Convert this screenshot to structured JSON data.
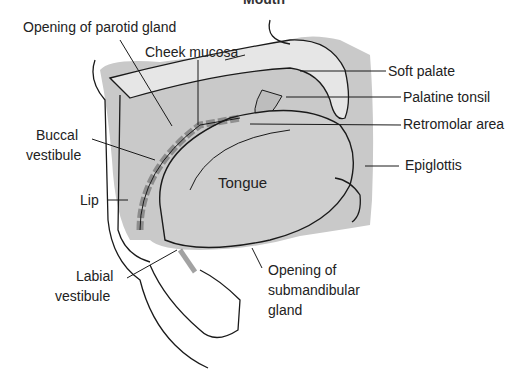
{
  "figure": {
    "header_fragment": "Mouth",
    "colors": {
      "shade": "#c9c9c9",
      "shade_dark": "#b5b5b5",
      "line": "#1a1a1a",
      "background": "#ffffff"
    }
  },
  "labels": {
    "parotid": "Opening of parotid gland",
    "cheek": "Cheek mucosa",
    "soft_palate": "Soft palate",
    "palatine_tonsil": "Palatine tonsil",
    "retromolar": "Retromolar area",
    "buccal_1": "Buccal",
    "buccal_2": "vestibule",
    "epiglottis": "Epiglottis",
    "tongue": "Tongue",
    "lip": "Lip",
    "labial_1": "Labial",
    "labial_2": "vestibule",
    "submand_1": "Opening of",
    "submand_2": "submandibular",
    "submand_3": "gland"
  }
}
